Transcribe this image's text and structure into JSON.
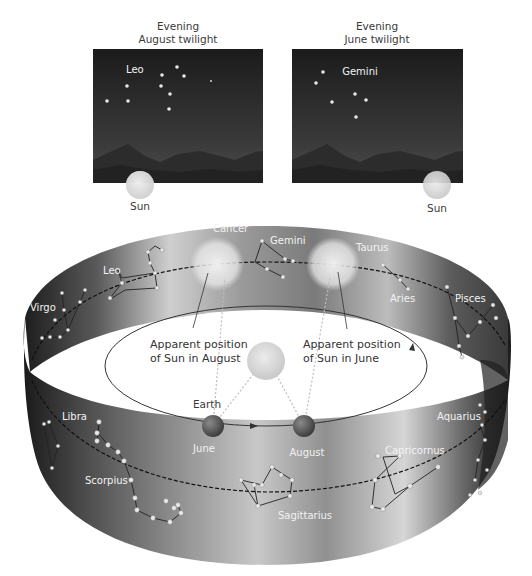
{
  "panels": {
    "august": {
      "title_line1": "Evening",
      "title_line2": "August twilight",
      "constellation": "Leo",
      "sun_label": "Sun"
    },
    "june": {
      "title_line1": "Evening",
      "title_line2": "June twilight",
      "constellation": "Gemini",
      "sun_label": "Sun"
    }
  },
  "zodiac_band": {
    "constellations_back": [
      "Virgo",
      "Leo",
      "Cancer",
      "Gemini",
      "Taurus",
      "Aries",
      "Pisces"
    ],
    "constellations_front": [
      "Libra",
      "Scorpius",
      "Sagittarius",
      "Capricornus",
      "Aquarius"
    ],
    "labels": {
      "virgo": "Virgo",
      "leo": "Leo",
      "cancer": "Cancer",
      "gemini": "Gemini",
      "taurus": "Taurus",
      "aries": "Aries",
      "pisces": "Pisces",
      "libra": "Libra",
      "scorpius": "Scorpius",
      "sagittarius": "Sagittarius",
      "capricornus": "Capricornus",
      "aquarius": "Aquarius"
    }
  },
  "orbit": {
    "earth_label": "Earth",
    "june_label": "June",
    "august_label": "August",
    "apparent_august_line1": "Apparent position",
    "apparent_august_line2": "of Sun in August",
    "apparent_june_line1": "Apparent position",
    "apparent_june_line2": "of Sun in June"
  },
  "colors": {
    "sky_top": "#1c1c1c",
    "sky_bottom": "#4a4a4a",
    "band_dark": "#2a2a2a",
    "band_light": "#e6e6e6",
    "sun": "#d9d9d9",
    "earth": "#5a5a5a"
  }
}
